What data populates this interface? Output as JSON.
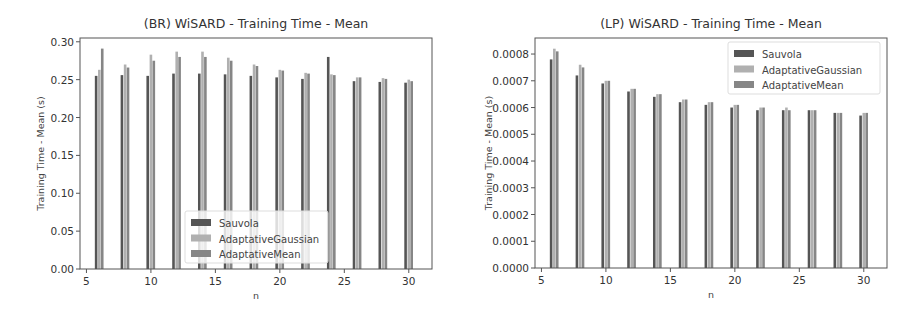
{
  "charts": [
    {
      "title": "(BR) WiSARD - Training Time - Mean",
      "xlabel": "n",
      "ylabel": "Training Time - Mean (s)",
      "yticks": [
        "0.00",
        "0.05",
        "0.10",
        "0.15",
        "0.20",
        "0.25",
        "0.30"
      ],
      "xticks": [
        "5",
        "10",
        "15",
        "20",
        "25",
        "30"
      ],
      "legend": [
        "Sauvola",
        "AdaptativeGaussian",
        "AdaptativeMean"
      ]
    },
    {
      "title": "(LP) WiSARD - Training Time - Mean",
      "xlabel": "n",
      "ylabel": "Training Time - Mean (s)",
      "yticks": [
        "0.0000",
        "0.0001",
        "0.0002",
        "0.0003",
        "0.0004",
        "0.0005",
        "0.0006",
        "0.0007",
        "0.0008"
      ],
      "xticks": [
        "5",
        "10",
        "15",
        "20",
        "25",
        "30"
      ],
      "legend": [
        "Sauvola",
        "AdaptativeGaussian",
        "AdaptativeMean"
      ]
    }
  ],
  "colors": {
    "Sauvola": "#555555",
    "AdaptativeGaussian": "#b0b0b0",
    "AdaptativeMean": "#868686"
  },
  "chart_data": [
    {
      "type": "bar",
      "title": "(BR) WiSARD - Training Time - Mean",
      "xlabel": "n",
      "ylabel": "Training Time - Mean (s)",
      "x": [
        6,
        8,
        10,
        12,
        14,
        16,
        18,
        20,
        22,
        24,
        26,
        28,
        30
      ],
      "series": [
        {
          "name": "Sauvola",
          "values": [
            0.255,
            0.256,
            0.255,
            0.258,
            0.258,
            0.257,
            0.255,
            0.253,
            0.251,
            0.28,
            0.248,
            0.247,
            0.246
          ]
        },
        {
          "name": "AdaptativeGaussian",
          "values": [
            0.263,
            0.27,
            0.283,
            0.287,
            0.287,
            0.279,
            0.27,
            0.263,
            0.259,
            0.257,
            0.253,
            0.252,
            0.25
          ]
        },
        {
          "name": "AdaptativeMean",
          "values": [
            0.291,
            0.266,
            0.275,
            0.28,
            0.28,
            0.275,
            0.268,
            0.262,
            0.258,
            0.256,
            0.253,
            0.251,
            0.248
          ]
        }
      ],
      "xlim": [
        4.5,
        31.8
      ],
      "ylim": [
        0,
        0.305
      ],
      "grid": false,
      "legend_position": "lower center"
    },
    {
      "type": "bar",
      "title": "(LP) WiSARD - Training Time - Mean",
      "xlabel": "n",
      "ylabel": "Training Time - Mean (s)",
      "x": [
        6,
        8,
        10,
        12,
        14,
        16,
        18,
        20,
        22,
        24,
        26,
        28,
        30
      ],
      "series": [
        {
          "name": "Sauvola",
          "values": [
            0.00078,
            0.00072,
            0.00069,
            0.00066,
            0.00064,
            0.00062,
            0.00061,
            0.0006,
            0.00059,
            0.00059,
            0.00059,
            0.00058,
            0.00057
          ]
        },
        {
          "name": "AdaptativeGaussian",
          "values": [
            0.00082,
            0.00076,
            0.0007,
            0.00067,
            0.00065,
            0.00063,
            0.00062,
            0.00061,
            0.0006,
            0.0006,
            0.00059,
            0.00058,
            0.00058
          ]
        },
        {
          "name": "AdaptativeMean",
          "values": [
            0.00081,
            0.00075,
            0.0007,
            0.00067,
            0.00065,
            0.00063,
            0.00062,
            0.00061,
            0.0006,
            0.00059,
            0.00059,
            0.00058,
            0.00058
          ]
        }
      ],
      "xlim": [
        4.5,
        31.8
      ],
      "ylim": [
        0,
        0.00086
      ],
      "grid": false,
      "legend_position": "upper right"
    }
  ]
}
